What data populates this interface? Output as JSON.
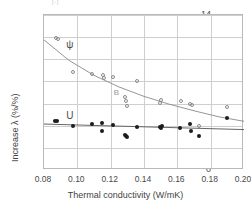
{
  "chart_data": {
    "type": "scatter",
    "title": "",
    "xlabel": "Thermal conductivity (W/mK)",
    "ylabel": "Increase λ (%/%)",
    "xlim": [
      0.08,
      0.2
    ],
    "ylim": [
      0,
      14
    ],
    "xticks": [
      "0.08",
      "0.10",
      "0.12",
      "0.14",
      "0.16",
      "0.18",
      "0.20"
    ],
    "xtick_values": [
      0.08,
      0.1,
      0.12,
      0.14,
      0.16,
      0.18,
      0.2
    ],
    "yticks": [
      "0",
      "2",
      "4",
      "6",
      "8",
      "10",
      "12",
      "14"
    ],
    "ytick_values": [
      0,
      2,
      4,
      6,
      8,
      10,
      12,
      14
    ],
    "grid": true,
    "legend_position": "inline-annotations",
    "annotations": [
      {
        "text": "ψ",
        "x": 0.0955,
        "y": 11.35,
        "style": "series-label"
      },
      {
        "text": "U",
        "x": 0.0955,
        "y": 4.95,
        "style": "series-label"
      },
      {
        "text": "B",
        "x": 0.1235,
        "y": 7.05,
        "style": "stray-label"
      }
    ],
    "top_note": "[-]",
    "series": [
      {
        "name": "ψ",
        "marker": "open-circle",
        "color": "#8a8a8a",
        "points": [
          [
            0.087,
            11.95
          ],
          [
            0.0885,
            11.8
          ],
          [
            0.0975,
            8.85
          ],
          [
            0.1085,
            8.7
          ],
          [
            0.1155,
            8.6
          ],
          [
            0.116,
            8.35
          ],
          [
            0.1215,
            8.4
          ],
          [
            0.1285,
            6.55
          ],
          [
            0.129,
            6.2
          ],
          [
            0.1295,
            5.8
          ],
          [
            0.1355,
            8.05
          ],
          [
            0.1495,
            6.05
          ],
          [
            0.15,
            6.3
          ],
          [
            0.162,
            6.25
          ],
          [
            0.1675,
            6.0
          ],
          [
            0.1685,
            5.85
          ],
          [
            0.173,
            4.0
          ],
          [
            0.1895,
            5.65
          ]
        ],
        "trend": {
          "type": "exponential-decay",
          "points": [
            [
              0.08,
              11.75
            ],
            [
              0.095,
              9.9
            ],
            [
              0.11,
              8.55
            ],
            [
              0.125,
              7.5
            ],
            [
              0.14,
              6.65
            ],
            [
              0.155,
              5.95
            ],
            [
              0.17,
              5.35
            ],
            [
              0.185,
              4.8
            ],
            [
              0.2,
              4.4
            ]
          ]
        }
      },
      {
        "name": "U",
        "marker": "filled-circle",
        "color": "#1c1c1c",
        "points": [
          [
            0.0865,
            4.45
          ],
          [
            0.0875,
            4.4
          ],
          [
            0.0975,
            4.0
          ],
          [
            0.1085,
            4.2
          ],
          [
            0.1145,
            4.25
          ],
          [
            0.115,
            3.55
          ],
          [
            0.1215,
            4.1
          ],
          [
            0.1285,
            3.2
          ],
          [
            0.129,
            3.05
          ],
          [
            0.13,
            2.95
          ],
          [
            0.1355,
            3.9
          ],
          [
            0.1495,
            3.9
          ],
          [
            0.15,
            3.8
          ],
          [
            0.1505,
            4.0
          ],
          [
            0.1615,
            3.75
          ],
          [
            0.1675,
            4.2
          ],
          [
            0.168,
            3.55
          ],
          [
            0.173,
            3.05
          ],
          [
            0.1895,
            4.7
          ]
        ],
        "trend": {
          "type": "linear",
          "points": [
            [
              0.08,
              4.15
            ],
            [
              0.2,
              3.65
            ]
          ]
        }
      }
    ]
  }
}
